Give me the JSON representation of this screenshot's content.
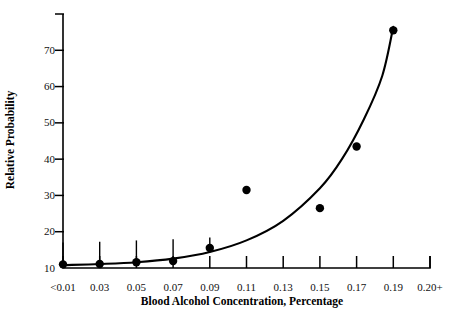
{
  "chart_data": {
    "type": "scatter",
    "title": "",
    "subtitle": "",
    "xlabel": "Blood Alcohol Concentration, Percentage",
    "ylabel": "Relative Probability",
    "categories": [
      "<0.01",
      "0.03",
      "0.05",
      "0.07",
      "0.09",
      "0.11",
      "0.13",
      "0.15",
      "0.17",
      "0.19",
      "0.20+"
    ],
    "x_tick_labels": [
      "<0.01",
      "0.03",
      "0.05",
      "0.07",
      "0.09",
      "0.11",
      "0.13",
      "0.15",
      "0.17",
      "0.19",
      "0.20+"
    ],
    "y_tick_labels": [
      "10",
      "20",
      "30",
      "40",
      "50",
      "60",
      "70"
    ],
    "y_ticks": [
      10,
      20,
      30,
      40,
      50,
      60,
      70
    ],
    "ylim": [
      0,
      70
    ],
    "xlim_index": [
      0,
      10
    ],
    "grid": false,
    "legend": null,
    "legend_position": "none",
    "series": [
      {
        "name": "Relative probability of crash involvement",
        "marker": "filled-circle",
        "points": [
          {
            "x_label": "<0.01",
            "x_index": 0,
            "y": 1.0
          },
          {
            "x_label": "0.03",
            "x_index": 1,
            "y": 1.1
          },
          {
            "x_label": "0.05",
            "x_index": 2,
            "y": 1.6
          },
          {
            "x_label": "0.07",
            "x_index": 3,
            "y": 1.9
          },
          {
            "x_label": "0.09",
            "x_index": 4,
            "y": 5.5
          },
          {
            "x_label": "0.11",
            "x_index": 5,
            "y": 21.5
          },
          {
            "x_label": "0.15",
            "x_index": 7,
            "y": 16.5
          },
          {
            "x_label": "0.17",
            "x_index": 8,
            "y": 33.5
          },
          {
            "x_label": "0.19",
            "x_index": 9,
            "y": 65.5
          }
        ]
      }
    ],
    "error_bars": [
      {
        "x_label": "<0.01",
        "x_index": 0,
        "y": 1.0,
        "upper": 7.0
      },
      {
        "x_label": "0.03",
        "x_index": 1,
        "y": 1.1,
        "upper": 7.2
      },
      {
        "x_label": "0.05",
        "x_index": 2,
        "y": 1.6,
        "upper": 7.6
      },
      {
        "x_label": "0.07",
        "x_index": 3,
        "y": 1.9,
        "upper": 7.9
      },
      {
        "x_label": "0.09",
        "x_index": 4,
        "y": 5.5,
        "upper": 8.4
      }
    ],
    "fit_curve": {
      "name": "exponential fit",
      "points": [
        {
          "x_index": 0.0,
          "y": 0.8
        },
        {
          "x_index": 1.0,
          "y": 1.1
        },
        {
          "x_index": 2.0,
          "y": 1.6
        },
        {
          "x_index": 3.0,
          "y": 2.6
        },
        {
          "x_index": 4.0,
          "y": 4.4
        },
        {
          "x_index": 5.0,
          "y": 7.6
        },
        {
          "x_index": 6.0,
          "y": 13.0
        },
        {
          "x_index": 7.0,
          "y": 22.0
        },
        {
          "x_index": 7.6,
          "y": 30.0
        },
        {
          "x_index": 8.2,
          "y": 41.0
        },
        {
          "x_index": 8.7,
          "y": 53.0
        },
        {
          "x_index": 9.0,
          "y": 66.5
        }
      ]
    }
  }
}
